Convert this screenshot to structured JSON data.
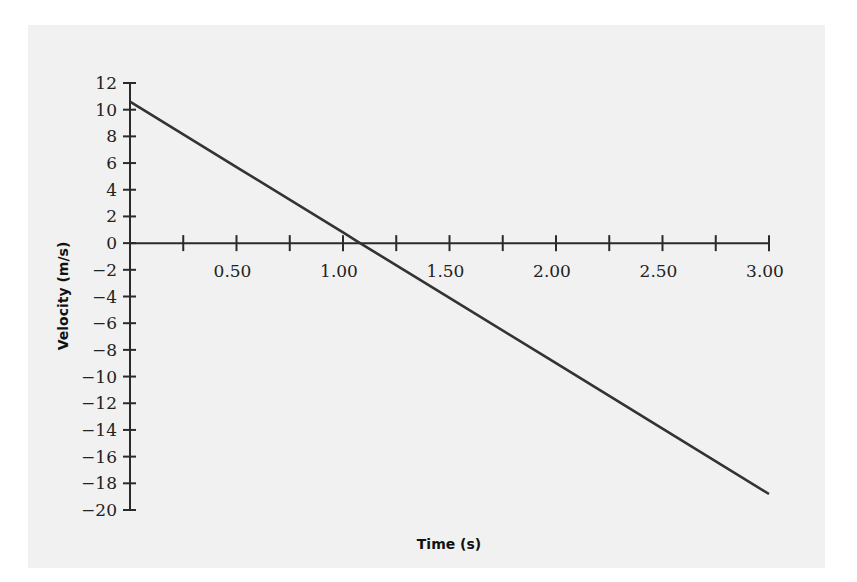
{
  "chart_data": {
    "type": "line",
    "title": "",
    "xlabel": "Time (s)",
    "ylabel": "Velocity (m/s)",
    "xlim": [
      0,
      3.0
    ],
    "ylim": [
      -20,
      12
    ],
    "grid": false,
    "legend": null,
    "x_ticks": [
      0.25,
      0.5,
      0.75,
      1.0,
      1.25,
      1.5,
      1.75,
      2.0,
      2.25,
      2.5,
      2.75,
      3.0
    ],
    "x_tick_labels": [
      {
        "value": 0.5,
        "label": "0.50"
      },
      {
        "value": 1.0,
        "label": "1.00"
      },
      {
        "value": 1.5,
        "label": "1.50"
      },
      {
        "value": 2.0,
        "label": "2.00"
      },
      {
        "value": 2.5,
        "label": "2.50"
      },
      {
        "value": 3.0,
        "label": "3.00"
      }
    ],
    "y_ticks": [
      12,
      10,
      8,
      6,
      4,
      2,
      0,
      -2,
      -4,
      -6,
      -8,
      -10,
      -12,
      -14,
      -16,
      -18,
      -20
    ],
    "y_tick_labels": [
      "12",
      "10",
      "8",
      "6",
      "4",
      "2",
      "0",
      "−2",
      "−4",
      "−6",
      "−8",
      "−10",
      "−12",
      "−14",
      "−16",
      "−18",
      "−20"
    ],
    "series": [
      {
        "name": "velocity",
        "x": [
          0,
          0.5,
          1.0,
          1.08,
          1.5,
          2.0,
          2.5,
          3.0
        ],
        "y": [
          10.6,
          5.7,
          0.8,
          0.0,
          -4.1,
          -9.0,
          -13.9,
          -18.8
        ],
        "color": "#333333"
      }
    ]
  }
}
